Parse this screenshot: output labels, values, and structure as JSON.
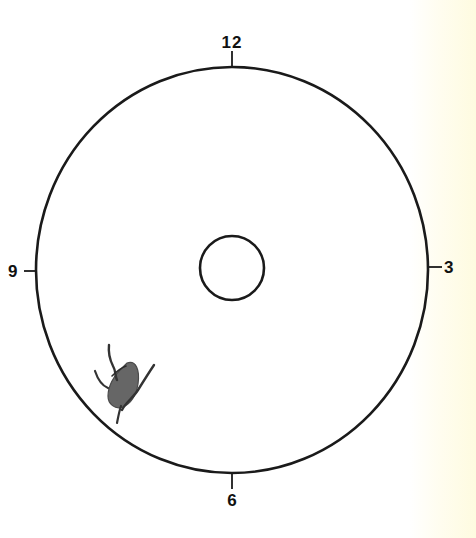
{
  "diagram": {
    "type": "clock-face-map",
    "labels": {
      "top": "12",
      "right": "3",
      "bottom": "6",
      "left": "9"
    },
    "outer_circle": {
      "cx": 232,
      "cy": 270,
      "rx": 196,
      "ry": 203
    },
    "inner_circle": {
      "cx": 232,
      "cy": 268,
      "r": 32
    },
    "marking": {
      "description": "sketched lesion with branching vessels",
      "clock_position": "7-8 o'clock",
      "fill_color": "#555555"
    },
    "colors": {
      "stroke": "#1a1a1a",
      "background": "#ffffff",
      "edge_tint": "#fefbe0"
    }
  }
}
